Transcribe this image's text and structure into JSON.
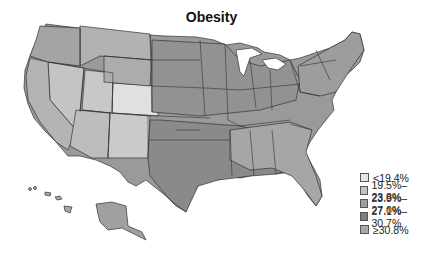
{
  "title": "Obesity",
  "legend": {
    "items": [
      {
        "label": "<19.4%",
        "color": "#e6e6e6"
      },
      {
        "label": "19.5%–23.8%",
        "color": "#c2c2c2"
      },
      {
        "label": "23.9%–27.0%",
        "color": "#9e9e9e"
      },
      {
        "label": "27.1%–30.7%",
        "color": "#7d7d7d"
      },
      {
        "label": "≥30.8%",
        "color": "#a9a9a9"
      }
    ]
  },
  "map": {
    "region": "United States (county-level)",
    "colors": {
      "state_border": "#333333",
      "base_fill": "#9a9a9a",
      "light_fill": "#cfcfcf",
      "lightest_fill": "#e2e2e2",
      "dark_fill": "#858585"
    }
  }
}
